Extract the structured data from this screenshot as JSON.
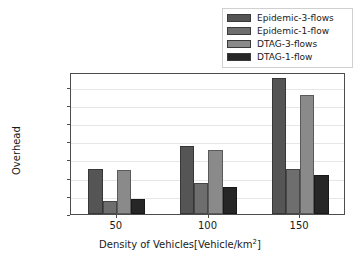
{
  "chart_data": {
    "type": "bar",
    "title": "",
    "xlabel": "Density of Vehicles[Vehicle/km²]",
    "ylabel": "Overhead",
    "categories": [
      "50",
      "100",
      "150"
    ],
    "ylim": [
      0,
      195000
    ],
    "yticks": [
      0,
      25000,
      50000,
      75000,
      100000,
      125000,
      150000,
      175000
    ],
    "ytick_labels": [
      "0",
      "25000",
      "50000",
      "75000",
      "100000",
      "125000",
      "150000",
      "175000"
    ],
    "grid": true,
    "legend_position": "upper right",
    "series": [
      {
        "name": "Epidemic-3-flows",
        "color": "#555555",
        "values": [
          62500,
          93000,
          187000
        ]
      },
      {
        "name": "Epidemic-1-flow",
        "color": "#6e6e6e",
        "values": [
          18000,
          42000,
          62000
        ]
      },
      {
        "name": "DTAG-3-flows",
        "color": "#8a8a8a",
        "values": [
          61000,
          88000,
          163000
        ]
      },
      {
        "name": "DTAG-1-flow",
        "color": "#262626",
        "values": [
          20000,
          37000,
          53000
        ]
      }
    ]
  },
  "axes": {
    "frame_color": "#4d4d4d",
    "grid_color": "#e6e6e6",
    "background": "#ffffff"
  }
}
